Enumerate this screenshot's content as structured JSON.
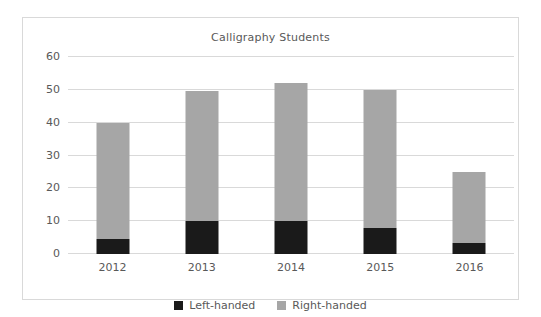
{
  "chart_data": {
    "type": "bar",
    "subtype": "stacked-column",
    "title": "Calligraphy Students",
    "xlabel": "",
    "ylabel": "",
    "categories": [
      "2012",
      "2013",
      "2014",
      "2015",
      "2016"
    ],
    "series": [
      {
        "name": "Left-handed",
        "color": "#1a1a1a",
        "values": [
          4.5,
          10,
          10,
          8,
          3.5
        ]
      },
      {
        "name": "Right-handed",
        "color": "#a6a6a6",
        "values": [
          35.5,
          39.5,
          42,
          42,
          21.5
        ]
      }
    ],
    "totals": [
      40,
      49.5,
      52,
      50,
      25
    ],
    "ylim": [
      0,
      60
    ],
    "yticks": [
      0,
      10,
      20,
      30,
      40,
      50,
      60
    ],
    "ytick_labels": [
      "0",
      "10",
      "20",
      "30",
      "40",
      "50",
      "60"
    ],
    "grid": true,
    "legend_position": "bottom",
    "colors": {
      "left_handed": "#1a1a1a",
      "right_handed": "#a6a6a6",
      "gridline": "#d9d9d9",
      "text": "#595959",
      "border": "#d9d9d9",
      "background": "#ffffff"
    }
  }
}
